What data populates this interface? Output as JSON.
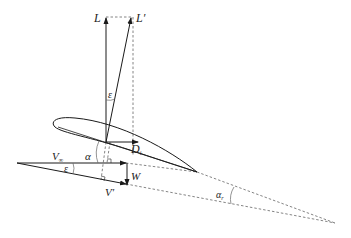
{
  "diagram": {
    "type": "airfoil-downwash-force-diagram",
    "labels": {
      "lift": "L",
      "lift_tilted": "L′",
      "epsilon_top": "ε",
      "drag_main": "D",
      "drag_sub": "i",
      "alpha": "α",
      "v_inf_main": "V",
      "v_inf_sub": "∞",
      "epsilon_bottom": "ε",
      "downwash": "W",
      "v_effective": "V′",
      "alpha_eff_main": "α",
      "alpha_eff_sub": "r"
    },
    "colors": {
      "line": "#1a1a1a",
      "dashed": "#555555",
      "background": "#ffffff"
    }
  }
}
